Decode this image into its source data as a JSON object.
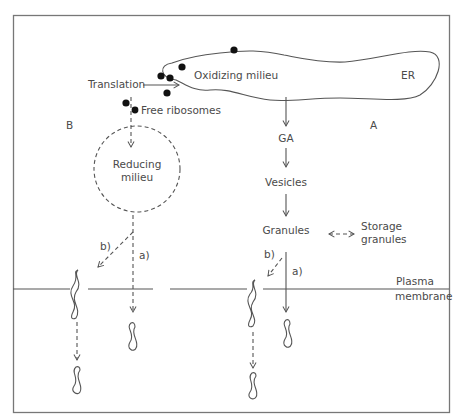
{
  "diagram": {
    "type": "protein-secretion-pathways",
    "colors": {
      "line": "#555555",
      "text": "#4a4a4a",
      "ribosome": "#111111",
      "frame": "#777777"
    },
    "labels": {
      "translation": "Translation",
      "oxidizing_milieu": "Oxidizing milieu",
      "er": "ER",
      "free_ribosomes": "Free ribosomes",
      "region_b": "B",
      "region_a": "A",
      "reducing_line1": "Reducing",
      "reducing_line2": "milieu",
      "ga": "GA",
      "vesicles": "Vesicles",
      "granules": "Granules",
      "storage_line1": "Storage",
      "storage_line2": "granules",
      "path_b_left": "b)",
      "path_a_left": "a)",
      "path_b_right": "b)",
      "path_a_right": "a)",
      "plasma_line1": "Plasma",
      "plasma_line2": "membrane"
    },
    "nodes": [
      "ER (Oxidizing milieu)",
      "Free ribosomes",
      "Reducing milieu",
      "GA",
      "Vesicles",
      "Granules",
      "Storage granules",
      "Plasma membrane"
    ],
    "edges": [
      {
        "from": "Translation",
        "to": "ER",
        "style": "solid"
      },
      {
        "from": "ER",
        "to": "GA",
        "style": "solid"
      },
      {
        "from": "GA",
        "to": "Vesicles",
        "style": "solid"
      },
      {
        "from": "Vesicles",
        "to": "Granules",
        "style": "solid"
      },
      {
        "from": "Granules",
        "to": "Storage granules",
        "style": "dashed-bidirectional"
      },
      {
        "from": "Granules",
        "to": "Extracellular (a)",
        "style": "solid"
      },
      {
        "from": "Granules",
        "to": "Membrane protein (b)",
        "style": "dashed"
      },
      {
        "from": "Free ribosomes",
        "to": "Reducing milieu",
        "style": "dashed"
      },
      {
        "from": "Reducing milieu",
        "to": "Extracellular (a)",
        "style": "dashed"
      },
      {
        "from": "Reducing milieu",
        "to": "Membrane protein (b)",
        "style": "dashed"
      }
    ]
  }
}
